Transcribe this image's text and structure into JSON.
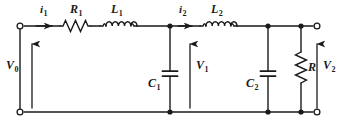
{
  "figure": {
    "type": "electrical-circuit-schematic",
    "width": 339,
    "height": 129,
    "line_color": "#1a1a1a",
    "background_color": "#ffffff"
  },
  "labels": {
    "current_1": {
      "text": "i",
      "sub": "1"
    },
    "current_2": {
      "text": "i",
      "sub": "2"
    },
    "resistor_1": {
      "text": "R",
      "sub": "1"
    },
    "inductor_1": {
      "text": "L",
      "sub": "1"
    },
    "inductor_2": {
      "text": "L",
      "sub": "2"
    },
    "capacitor_1": {
      "text": "C",
      "sub": "1"
    },
    "capacitor_2": {
      "text": "C",
      "sub": "2"
    },
    "resistor_load": {
      "text": "R",
      "sub": ""
    },
    "voltage_0": {
      "text": "V",
      "sub": "0"
    },
    "voltage_1": {
      "text": "V",
      "sub": "1"
    },
    "voltage_2": {
      "text": "V",
      "sub": "2"
    }
  },
  "nodes": {
    "input_top_terminal": {
      "x": 20,
      "y": 26
    },
    "input_bottom_terminal": {
      "x": 20,
      "y": 112
    },
    "output_top_terminal": {
      "x": 317,
      "y": 26
    },
    "output_bottom_terminal": {
      "x": 317,
      "y": 112
    },
    "junction_c1_top": {
      "x": 170,
      "y": 26
    },
    "junction_c1_bottom": {
      "x": 170,
      "y": 112
    },
    "junction_c2_top": {
      "x": 268,
      "y": 26
    },
    "junction_c2_bottom": {
      "x": 268,
      "y": 112
    },
    "junction_r_top": {
      "x": 301,
      "y": 26
    },
    "junction_r_bottom": {
      "x": 301,
      "y": 112
    }
  },
  "arrows": {
    "i1_direction": "right",
    "i2_direction": "right",
    "v0_direction": "up",
    "v1_direction": "up",
    "v2_direction": "up"
  }
}
